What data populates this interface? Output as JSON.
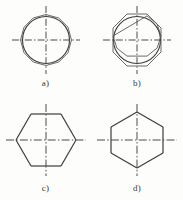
{
  "page": {
    "background_color": "#fdfdfc",
    "line_color": "#3c3c3c",
    "centerline_color": "#4a4a4a",
    "width": 183,
    "height": 200
  },
  "figures": [
    {
      "id": "a",
      "label": "a)",
      "description": "circle with circumscribed twelve-sided polygon and crossed centerlines",
      "shape": "dodecagon-in-circle",
      "circle": true,
      "sides": 12,
      "rotation_deg": 0,
      "center": {
        "x": 46,
        "y": 40
      },
      "circle_radius": 24,
      "polygon_radius": 26,
      "centerline_extent": 32
    },
    {
      "id": "b",
      "label": "b)",
      "description": "circle with circumscribed octagon and crossed centerlines",
      "shape": "octagon-in-circle",
      "circle": true,
      "sides": 8,
      "rotation_deg": 22.5,
      "center": {
        "x": 46,
        "y": 40
      },
      "circle_radius": 24,
      "polygon_radius": 26,
      "centerline_extent": 32
    },
    {
      "id": "c",
      "label": "c)",
      "description": "hexagon with pointed left and right vertices and crossed centerlines",
      "shape": "hexagon",
      "circle": false,
      "sides": 6,
      "rotation_deg": 0,
      "center": {
        "x": 46,
        "y": 44
      },
      "polygon_radius": 30,
      "centerline_extent": 36
    },
    {
      "id": "d",
      "label": "d)",
      "description": "hexagon with flat top and bottom edges and crossed centerlines",
      "shape": "hexagon",
      "circle": false,
      "sides": 6,
      "rotation_deg": 30,
      "center": {
        "x": 46,
        "y": 44
      },
      "polygon_radius": 30,
      "centerline_extent": 36
    }
  ]
}
